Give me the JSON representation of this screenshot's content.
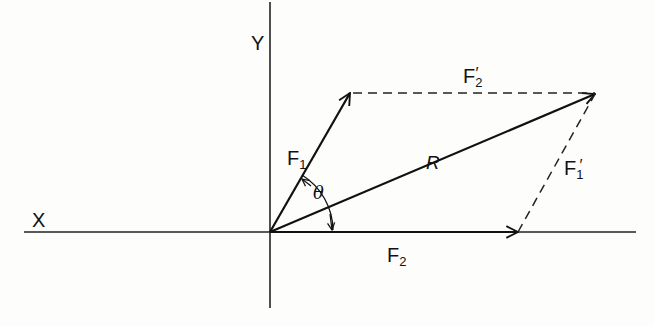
{
  "diagram": {
    "colors": {
      "line": "#111111",
      "background": "#fdfdfc"
    },
    "axes": {
      "x_label": "X",
      "y_label": "Y"
    },
    "vectors": {
      "F1": {
        "label": "F",
        "sub": "1"
      },
      "F2": {
        "label": "F",
        "sub": "2"
      },
      "R": {
        "label": "R"
      }
    },
    "construction_lines": {
      "F1_prime": {
        "label": "F",
        "sub": "1",
        "prime": "′"
      },
      "F2_prime": {
        "label": "F",
        "sub": "2",
        "prime": "′"
      }
    },
    "angle": {
      "label": "θ"
    }
  }
}
